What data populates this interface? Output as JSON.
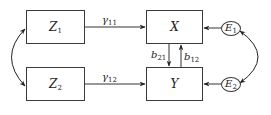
{
  "diagram": {
    "type": "path-diagram",
    "nodes": {
      "z1": {
        "base": "Z",
        "sub": "1",
        "shape": "rectangle"
      },
      "z2": {
        "base": "Z",
        "sub": "2",
        "shape": "rectangle"
      },
      "x": {
        "base": "X",
        "sub": "",
        "shape": "rectangle"
      },
      "y": {
        "base": "Y",
        "sub": "",
        "shape": "rectangle"
      },
      "e1": {
        "base": "E",
        "sub": "1",
        "shape": "ellipse"
      },
      "e2": {
        "base": "E",
        "sub": "2",
        "shape": "ellipse"
      }
    },
    "edges": {
      "g11": {
        "from": "Z1",
        "to": "X",
        "base": "γ",
        "sub": "11"
      },
      "g12": {
        "from": "Z2",
        "to": "Y",
        "base": "γ",
        "sub": "12"
      },
      "b21": {
        "from": "X",
        "to": "Y",
        "base": "b",
        "sub": "21"
      },
      "b12": {
        "from": "Y",
        "to": "X",
        "base": "b",
        "sub": "12"
      },
      "e1x": {
        "from": "E1",
        "to": "X"
      },
      "e2y": {
        "from": "E2",
        "to": "Y"
      },
      "z_cov": {
        "between": [
          "Z1",
          "Z2"
        ],
        "type": "double-headed-curve"
      },
      "e_cov": {
        "between": [
          "E1",
          "E2"
        ],
        "type": "double-headed-curve"
      }
    }
  }
}
